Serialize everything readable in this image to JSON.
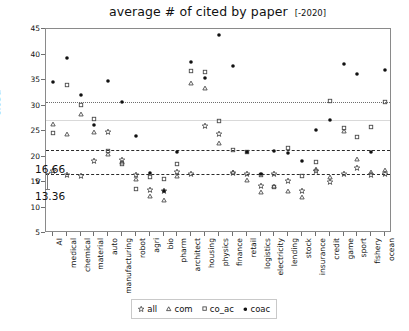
{
  "chart": {
    "title": "average # of cited by paper",
    "title_suffix": "[-2020]",
    "ylabel": "cited"
  },
  "chart_data": {
    "type": "scatter",
    "title": "average # of cited by paper  [-2020]",
    "xlabel": "",
    "ylabel": "cited",
    "ylim": [
      5,
      45
    ],
    "yticks": [
      5,
      10,
      15,
      20,
      25,
      30,
      35,
      40,
      45
    ],
    "grid": false,
    "legend_position": "below-axes",
    "categories": [
      "AI",
      "medical",
      "chemical",
      "material",
      "auto",
      "manufacturing",
      "robot",
      "agri",
      "bio",
      "pharm",
      "architect",
      "housing",
      "physics",
      "finance",
      "retail",
      "logistics",
      "electricity",
      "lending",
      "stock",
      "insurance",
      "credit",
      "game",
      "sport",
      "fishery",
      "ocean"
    ],
    "series": [
      {
        "name": "all",
        "marker": "star",
        "values": [
          17.2,
          16.4,
          16.2,
          19.1,
          24.8,
          19.4,
          16.3,
          13.4,
          13.3,
          17.0,
          16.6,
          25.9,
          24.5,
          16.7,
          16.6,
          14.2,
          16.5,
          15.2,
          13.2,
          17.2,
          15.0,
          16.6,
          17.8,
          16.4,
          16.5
        ]
      },
      {
        "name": "com",
        "marker": "triangle",
        "values": [
          26.3,
          24.5,
          28.3,
          24.8,
          20.5,
          18.9,
          15.5,
          12.3,
          11.4,
          16.2,
          34.5,
          33.5,
          22.6,
          17.0,
          15.3,
          13.0,
          14.2,
          13.2,
          12.1,
          17.5,
          16.0,
          25.0,
          19.5,
          17.0,
          17.4
        ]
      },
      {
        "name": "co_ac",
        "marker": "square",
        "values": [
          24.7,
          34.1,
          30.1,
          27.3,
          21.0,
          18.6,
          13.7,
          16.0,
          15.5,
          18.5,
          36.8,
          36.6,
          26.9,
          21.2,
          20.9,
          16.4,
          14.0,
          21.6,
          16.1,
          19.0,
          30.8,
          25.5,
          23.8,
          25.7,
          30.7
        ]
      },
      {
        "name": "coac",
        "marker": "circle",
        "values": [
          34.6,
          39.4,
          32.1,
          26.2,
          34.8,
          30.6,
          24.0,
          16.8,
          13.3,
          20.9,
          38.5,
          35.4,
          43.9,
          37.7,
          20.9,
          16.5,
          21.0,
          20.6,
          19.2,
          25.2,
          27.2,
          38.1,
          36.1,
          20.9,
          36.9
        ]
      }
    ],
    "reference_lines": [
      {
        "value": 30.7,
        "style": "dotted",
        "label": ""
      },
      {
        "value": 27.2,
        "style": "faint",
        "label": ""
      },
      {
        "value": 21.2,
        "style": "dashed",
        "label": ""
      },
      {
        "value": 16.66,
        "style": "dashed",
        "label": "16.66"
      }
    ],
    "annotations": [
      {
        "text": "16.66",
        "value": 16.66
      },
      {
        "text": "v",
        "value": 15.0
      },
      {
        "text": "13.36",
        "value": 13.36
      }
    ]
  },
  "legend": {
    "items": [
      {
        "label": "all",
        "marker": "star"
      },
      {
        "label": "com",
        "marker": "triangle"
      },
      {
        "label": "co_ac",
        "marker": "square"
      },
      {
        "label": "coac",
        "marker": "circle"
      }
    ]
  }
}
